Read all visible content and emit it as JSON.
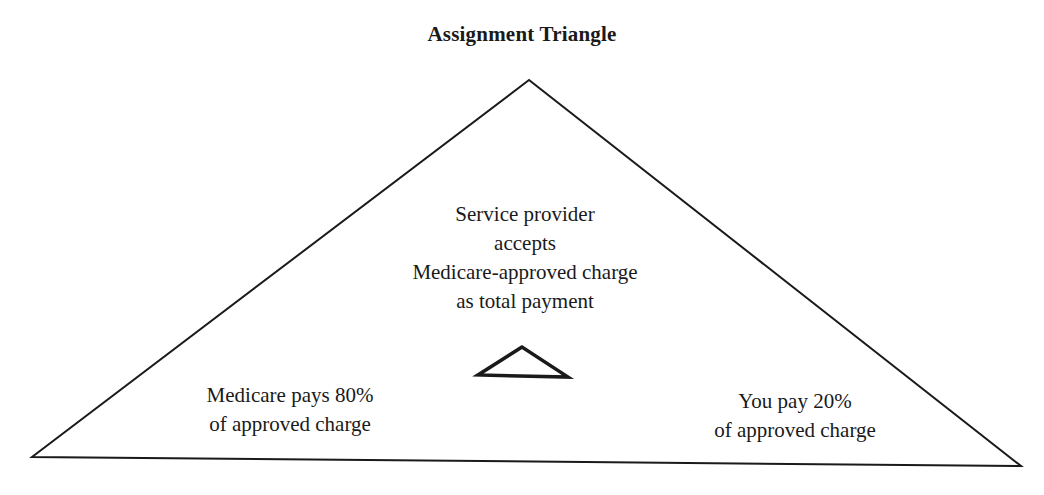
{
  "diagram": {
    "title": "Assignment Triangle",
    "center_label": {
      "lines": [
        "Service provider",
        "accepts",
        "Medicare-approved charge",
        "as total payment"
      ]
    },
    "left_label": {
      "lines": [
        "Medicare pays 80%",
        "of approved charge"
      ]
    },
    "right_label": {
      "lines": [
        "You pay 20%",
        "of approved charge"
      ]
    },
    "icons": {
      "big_triangle": "outline-triangle",
      "small_triangle": "delta-triangle-symbol"
    },
    "colors": {
      "stroke": "#1a1a1a",
      "background": "#ffffff"
    },
    "split": {
      "medicare_percent": 80,
      "you_percent": 20
    }
  }
}
